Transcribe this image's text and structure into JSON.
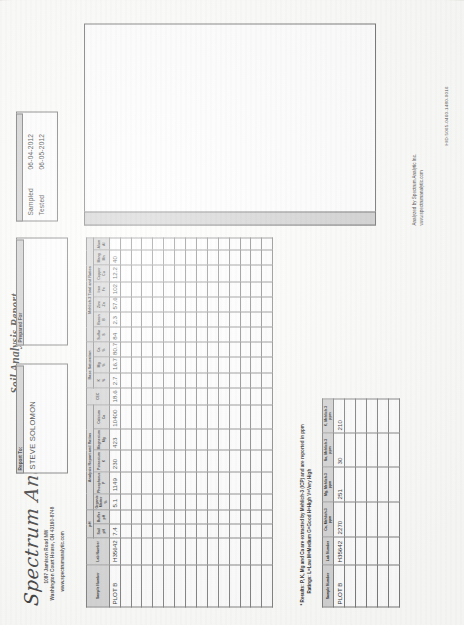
{
  "document": {
    "title": "Soil Analysis Report",
    "hid": "HID:5065-0460-1480-0016"
  },
  "company": {
    "name": "Spectrum Analytic",
    "address_line1": "1087 Jamison Road NW",
    "address_line2": "Washington Court House, OH 43160-8748",
    "website": "www.spectrumanalytic.com"
  },
  "report_to": {
    "header": "Report To:",
    "name": "STEVE SOLOMON"
  },
  "prepared_for": {
    "header": "Prepared For"
  },
  "dates": {
    "sampled_label": "Sampled",
    "sampled_value": "06-04-2012",
    "tested_label": "Tested",
    "tested_value": "06-05-2012"
  },
  "main_table": {
    "group_headers": {
      "ph": "pH",
      "analysis_report": "Analysis Report and Ratios",
      "base_saturation": "Base Saturation",
      "mehlich3": "Mehlich-3 Total and Ratios"
    },
    "columns": [
      {
        "key": "sample_number",
        "label": "Sample Number",
        "sub": ""
      },
      {
        "key": "lab_number",
        "label": "Lab Number",
        "sub": ""
      },
      {
        "key": "soil_ph",
        "label": "Soil",
        "sub": "pH"
      },
      {
        "key": "buffer_ph",
        "label": "Buffer",
        "sub": "pH"
      },
      {
        "key": "organic_matter",
        "label": "Organic Matter",
        "sub": "%"
      },
      {
        "key": "phosphorus",
        "label": "Phosphorus",
        "sub": "P"
      },
      {
        "key": "potassium",
        "label": "Potassium",
        "sub": "K"
      },
      {
        "key": "magnesium",
        "label": "Magnesium",
        "sub": "Mg"
      },
      {
        "key": "calcium",
        "label": "Calcium",
        "sub": "Ca"
      },
      {
        "key": "cec",
        "label": "CEC",
        "sub": ""
      },
      {
        "key": "k_pct",
        "label": "K",
        "sub": "%"
      },
      {
        "key": "mg_pct",
        "label": "Mg",
        "sub": "%"
      },
      {
        "key": "ca_pct",
        "label": "Ca",
        "sub": "%"
      },
      {
        "key": "sulfur",
        "label": "Sulfur",
        "sub": "S"
      },
      {
        "key": "boron",
        "label": "Boron",
        "sub": "B"
      },
      {
        "key": "zinc",
        "label": "Zinc",
        "sub": "Zn"
      },
      {
        "key": "iron",
        "label": "Iron",
        "sub": "Fe"
      },
      {
        "key": "copper",
        "label": "Copper",
        "sub": "Cu"
      },
      {
        "key": "manganese",
        "label": "Mang",
        "sub": "Mn"
      },
      {
        "key": "alum",
        "label": "Alum",
        "sub": "Al"
      }
    ],
    "rows": [
      {
        "sample_number": "PLOT B",
        "lab_number": "H35642",
        "soil_ph": "7.4",
        "buffer_ph": "",
        "organic_matter": "5.1",
        "phosphorus": "1149",
        "potassium": "230",
        "magnesium": "423",
        "calcium": "10400",
        "cec": "18.6",
        "k_pct": "2.7",
        "mg_pct": "16.7",
        "ca_pct": "80.7",
        "sulfur": "84",
        "boron": "2.3",
        "zinc": "57.6",
        "iron": "102",
        "copper": "12.2",
        "manganese": "40",
        "alum": ""
      }
    ],
    "blank_row_count": 14
  },
  "footnote": {
    "line1": "*  Results:  P, K, Mg and Ca are extracted by Mehlich-3 (ICP) and are reported in ppm",
    "line2": "Ratings:  L=Low  M=Medium  G=Good  H=High  V=Very High"
  },
  "secondary_table": {
    "columns": [
      {
        "key": "sample_number",
        "label": "Sample Number",
        "sub": ""
      },
      {
        "key": "lab_number",
        "label": "Lab Number",
        "sub": ""
      },
      {
        "key": "ca_m3",
        "label": "Ca, Mehlich-3",
        "sub": "ppm"
      },
      {
        "key": "mg_m3",
        "label": "Mg, Mehlich-3",
        "sub": "ppm"
      },
      {
        "key": "na_m3",
        "label": "Na, Mehlich-3",
        "sub": "ppm"
      },
      {
        "key": "k_m3",
        "label": "K, Mehlich-3",
        "sub": "ppm"
      }
    ],
    "rows": [
      {
        "sample_number": "PLOT B",
        "lab_number": "H35642",
        "ca_m3": "2270",
        "mg_m3": "251",
        "na_m3": "30",
        "k_m3": "210"
      }
    ],
    "blank_row_count": 5
  },
  "analyzed_by": {
    "line1": "Analyzed by Spectrum Analytic Inc.",
    "line2": "www.spectrumanalytic.com"
  },
  "colors": {
    "header_fill": "#d2d2d2",
    "border": "#7a7a7a",
    "paper": "#fdfdfb"
  }
}
